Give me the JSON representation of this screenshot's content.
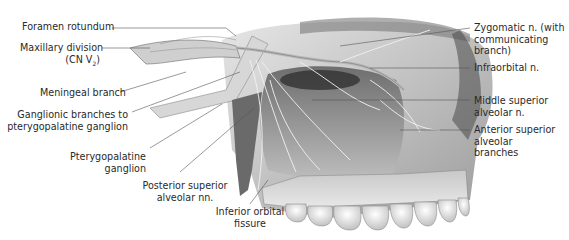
{
  "figure": {
    "palette": {
      "ink": "#2a2a2a",
      "bone_light": "#d9d9d9",
      "bone_mid": "#a8a8a8",
      "shadow": "#3a3a3a",
      "leader": "#555555"
    }
  },
  "labels": {
    "foramen_rotundum": "Foramen  rotundum",
    "maxillary_division_1": "Maxillary division",
    "maxillary_division_2": "(CN V",
    "maxillary_division_sub": "2",
    "maxillary_division_3": ")",
    "meningeal_branch": "Meningeal branch",
    "ganglionic_branches_1": "Ganglionic branches to",
    "ganglionic_branches_2": "pterygopalatine ganglion",
    "pterygopalatine_ganglion_1": "Pterygopalatine",
    "pterygopalatine_ganglion_2": "ganglion",
    "posterior_superior_1": "Posterior superior",
    "posterior_superior_2": "alveolar nn.",
    "inferior_orbital_1": "Inferior orbital",
    "inferior_orbital_2": "fissure",
    "zygomatic_1": "Zygomatic n. (with",
    "zygomatic_2": "communicating",
    "zygomatic_3": "branch)",
    "infraorbital": "Infraorbital n.",
    "middle_superior_1": "Middle superior",
    "middle_superior_2": "alveolar n.",
    "anterior_superior_1": "Anterior superior",
    "anterior_superior_2": "alveolar",
    "anterior_superior_3": "branches"
  }
}
